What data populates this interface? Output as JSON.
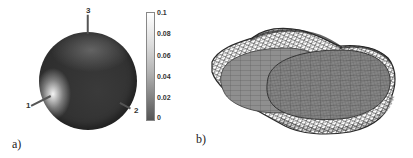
{
  "figure": {
    "panels": [
      {
        "label": "a)",
        "description": "Sphere colored by scalar field with colorbar",
        "markers": [
          {
            "id": "1",
            "label": "1"
          },
          {
            "id": "2",
            "label": "2"
          },
          {
            "id": "3",
            "label": "3"
          }
        ],
        "colorbar": {
          "ticks": [
            "0.1",
            "0.08",
            "0.06",
            "0.04",
            "0.02",
            "0"
          ],
          "min": 0,
          "max": 0.1,
          "colormap": "grayscale (dark = 0, white = 0.1)"
        }
      },
      {
        "label": "b)",
        "description": "Shaded ellipsoidal surface mesh overlaid with irregular wireframe mesh"
      }
    ]
  },
  "colors": {
    "sphere_base": "#303030",
    "highlight": "#ffffff",
    "mesh_line": "#2a2a2a",
    "solid_surface": "#8c8c8c"
  }
}
